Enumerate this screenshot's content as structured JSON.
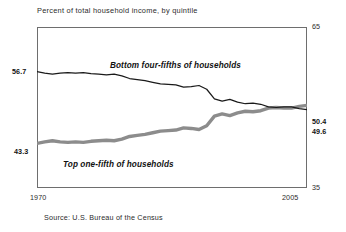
{
  "figure": {
    "title": "Percent of total household income, by quintile",
    "source": "Source: U.S. Bureau of the Census",
    "axis": {
      "y_max_label": "65",
      "y_min_label": "35",
      "x_min_label": "1970",
      "x_max_label": "2005"
    },
    "endpoint_labels": {
      "bottom_four_fifths_start": "56.7",
      "bottom_four_fifths_end": "49.6",
      "top_one_fifth_start": "43.3",
      "top_one_fifth_end": "50.4"
    },
    "series_labels": {
      "bottom_four_fifths": "Bottom four-fifths of households",
      "top_one_fifth": "Top one-fifth of households"
    },
    "colors": {
      "bottom_four_fifths_line": "#1a1a1a",
      "top_one_fifth_line": "#8c8c8c",
      "frame": "#6e6e6e",
      "background": "#ffffff"
    }
  },
  "chart_data": {
    "type": "line",
    "title": "Percent of total household income, by quintile",
    "subtitle": "",
    "xlabel": "",
    "ylabel": "",
    "xlim": [
      1970,
      2005
    ],
    "ylim": [
      35,
      65
    ],
    "grid": false,
    "legend": "inline-annotations",
    "source": "Source: U.S. Bureau of the Census",
    "x": [
      1970,
      1971,
      1972,
      1973,
      1974,
      1975,
      1976,
      1977,
      1978,
      1979,
      1980,
      1981,
      1982,
      1983,
      1984,
      1985,
      1986,
      1987,
      1988,
      1989,
      1990,
      1991,
      1992,
      1993,
      1994,
      1995,
      1996,
      1997,
      1998,
      1999,
      2000,
      2001,
      2002,
      2003,
      2004,
      2005
    ],
    "series": [
      {
        "name": "Bottom four-fifths of households",
        "color": "#1a1a1a",
        "style": "thin",
        "start_value": 56.7,
        "end_value": 49.6,
        "values": [
          56.7,
          56.4,
          56.2,
          56.4,
          56.5,
          56.4,
          56.5,
          56.3,
          56.2,
          56.1,
          56.2,
          55.9,
          55.4,
          55.2,
          55.0,
          54.7,
          54.4,
          54.3,
          54.2,
          53.8,
          53.9,
          54.1,
          53.4,
          51.6,
          51.2,
          51.5,
          51.0,
          50.7,
          50.8,
          50.6,
          50.1,
          50.0,
          50.1,
          50.1,
          49.8,
          49.6
        ]
      },
      {
        "name": "Top one-fifth of households",
        "color": "#8c8c8c",
        "style": "thick",
        "start_value": 43.3,
        "end_value": 50.4,
        "values": [
          43.3,
          43.6,
          43.8,
          43.6,
          43.5,
          43.6,
          43.5,
          43.7,
          43.8,
          43.9,
          43.8,
          44.1,
          44.6,
          44.8,
          45.0,
          45.3,
          45.6,
          45.7,
          45.8,
          46.2,
          46.1,
          45.9,
          46.6,
          48.4,
          48.8,
          48.5,
          49.0,
          49.3,
          49.2,
          49.4,
          49.9,
          50.0,
          49.9,
          49.9,
          50.2,
          50.4
        ]
      }
    ],
    "annotations": [
      {
        "text": "56.7",
        "position": "left-start",
        "series": "Bottom four-fifths of households"
      },
      {
        "text": "43.3",
        "position": "left-start",
        "series": "Top one-fifth of households"
      },
      {
        "text": "50.4",
        "position": "right-end",
        "series": "Top one-fifth of households"
      },
      {
        "text": "49.6",
        "position": "right-end",
        "series": "Bottom four-fifths of households"
      }
    ]
  }
}
